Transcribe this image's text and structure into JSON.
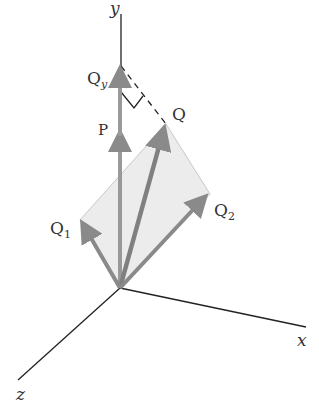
{
  "axes": {
    "x": "x",
    "y": "y",
    "z": "z"
  },
  "vectors": {
    "P": "P",
    "Q": "Q",
    "Q1": {
      "base": "Q",
      "sub": "1"
    },
    "Q2": {
      "base": "Q",
      "sub": "2"
    },
    "Qy": {
      "base": "Q",
      "sub": "y"
    }
  },
  "colors": {
    "arrow": "#8a8a8a",
    "plane": "#e9e9e9",
    "axis": "#222222"
  }
}
